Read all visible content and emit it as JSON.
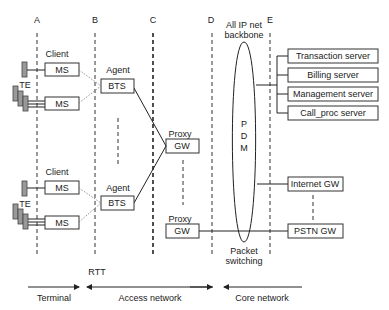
{
  "columns": {
    "a": "A",
    "b": "B",
    "c": "C",
    "d": "D",
    "e": "E"
  },
  "backbone": {
    "title_line1": "All IP net",
    "title_line2": "backbone",
    "pdm": [
      "P",
      "D",
      "M"
    ],
    "bottom_line1": "Packet",
    "bottom_line2": "switching"
  },
  "terminal": {
    "client": "Client",
    "te": "TE",
    "ms": "MS"
  },
  "agent": {
    "label": "Agent",
    "bts": "BTS"
  },
  "proxy": {
    "label": "Proxy",
    "gw": "GW"
  },
  "servers": [
    "Transaction server",
    "Billing server",
    "Management server",
    "Call_proc server"
  ],
  "gateways": [
    "Internet GW",
    "PSTN GW"
  ],
  "footer": {
    "rtt": "RTT",
    "terminal": "Terminal",
    "access": "Access network",
    "core": "Core network"
  }
}
